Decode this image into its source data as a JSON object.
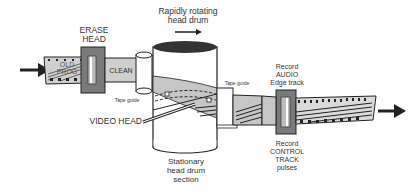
{
  "labels": {
    "erase_head": [
      "ERASE",
      "HEAD"
    ],
    "old_prog": [
      "OLD",
      "PROG"
    ],
    "clean": "CLEAN",
    "rotating_drum": [
      "Rapidly rotating",
      "head drum"
    ],
    "tape_guide_left": "Tape guide",
    "tape_guide_right": "Tape guide",
    "video_head": "VIDEO HEAD",
    "stationary_drum": [
      "Stationary",
      "head drum",
      "section"
    ],
    "record_audio": [
      "Record",
      "AUDIO",
      "Edge track"
    ],
    "record_control": [
      "Record",
      "CONTROL",
      "TRACK",
      "pulses"
    ]
  },
  "colors": {
    "tape": "#c8c8c8",
    "head": "#7a7a7a",
    "drum_top": "#333333",
    "ink": "#222222"
  }
}
